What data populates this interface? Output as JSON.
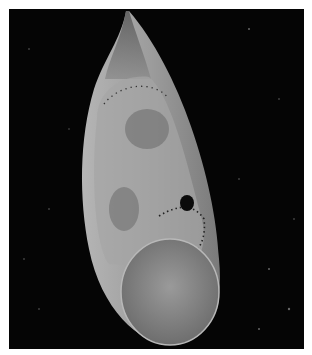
{
  "image": {
    "subject": "embryo inside elongated translucent egg capsule",
    "background_color": "#050505",
    "border_color": "#ffffff",
    "capsule_color": "#8a8a8a",
    "yolk_color": "#7d7d7d",
    "eye_color": "#0a0a0a"
  }
}
